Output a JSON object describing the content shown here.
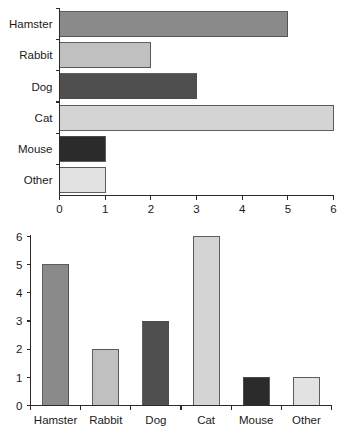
{
  "chart_data": [
    {
      "type": "bar",
      "orientation": "horizontal",
      "title": "",
      "subtitle": "",
      "xlabel": "",
      "ylabel": "",
      "categories": [
        "Hamster",
        "Rabbit",
        "Dog",
        "Cat",
        "Mouse",
        "Other"
      ],
      "values": [
        5,
        2,
        3,
        6,
        1,
        1
      ],
      "xlim": [
        0,
        6
      ],
      "xticks": [
        0,
        1,
        2,
        3,
        4,
        5,
        6
      ],
      "xtick_labels": [
        "0",
        "1",
        "2",
        "3",
        "4",
        "5",
        "6"
      ],
      "grid": false,
      "legend": false,
      "bar_colors": [
        "#8a8a8a",
        "#c0c0c0",
        "#4f4f4f",
        "#d4d4d4",
        "#2b2b2b",
        "#e2e2e2"
      ],
      "bar_edge_color": "#4d4d4d"
    },
    {
      "type": "bar",
      "orientation": "vertical",
      "title": "",
      "subtitle": "",
      "xlabel": "",
      "ylabel": "",
      "categories": [
        "Hamster",
        "Rabbit",
        "Dog",
        "Cat",
        "Mouse",
        "Other"
      ],
      "values": [
        5,
        2,
        3,
        6,
        1,
        1
      ],
      "ylim": [
        0,
        6
      ],
      "yticks": [
        0,
        1,
        2,
        3,
        4,
        5,
        6
      ],
      "ytick_labels": [
        "0",
        "1",
        "2",
        "3",
        "4",
        "5",
        "6"
      ],
      "grid": false,
      "legend": false,
      "bar_colors": [
        "#8a8a8a",
        "#c0c0c0",
        "#4f4f4f",
        "#d4d4d4",
        "#2b2b2b",
        "#e2e2e2"
      ],
      "bar_edge_color": "#4d4d4d"
    }
  ],
  "hbar": {
    "categories": [
      {
        "label": "Hamster",
        "value": 5,
        "color": "#8a8a8a"
      },
      {
        "label": "Rabbit",
        "value": 2,
        "color": "#c0c0c0"
      },
      {
        "label": "Dog",
        "value": 3,
        "color": "#4f4f4f"
      },
      {
        "label": "Cat",
        "value": 6,
        "color": "#d4d4d4"
      },
      {
        "label": "Mouse",
        "value": 1,
        "color": "#2b2b2b"
      },
      {
        "label": "Other",
        "value": 1,
        "color": "#e2e2e2"
      }
    ],
    "axis_ticks": [
      "0",
      "1",
      "2",
      "3",
      "4",
      "5",
      "6"
    ]
  },
  "vbar": {
    "categories": [
      {
        "label": "Hamster",
        "value": 5,
        "color": "#8a8a8a"
      },
      {
        "label": "Rabbit",
        "value": 2,
        "color": "#c0c0c0"
      },
      {
        "label": "Dog",
        "value": 3,
        "color": "#4f4f4f"
      },
      {
        "label": "Cat",
        "value": 6,
        "color": "#d4d4d4"
      },
      {
        "label": "Mouse",
        "value": 1,
        "color": "#2b2b2b"
      },
      {
        "label": "Other",
        "value": 1,
        "color": "#e2e2e2"
      }
    ],
    "axis_ticks": [
      "6",
      "5",
      "4",
      "3",
      "2",
      "1",
      "0"
    ]
  }
}
